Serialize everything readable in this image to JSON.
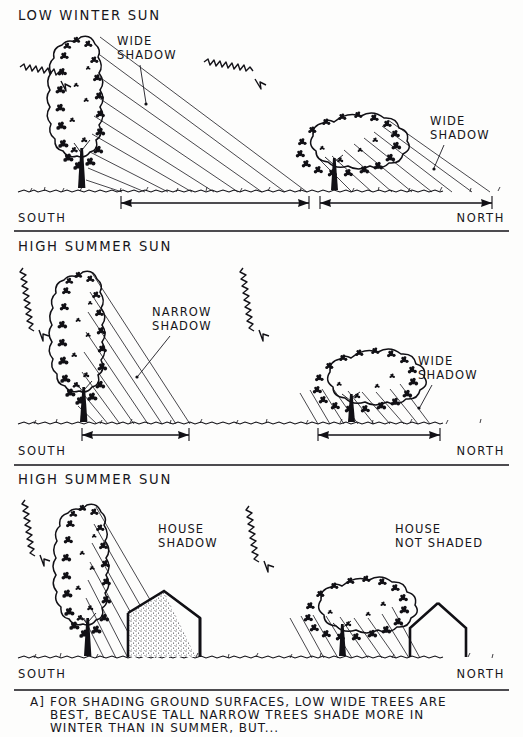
{
  "figure": {
    "ink_color": "#111015",
    "paper_color": "#fdfdfc"
  },
  "panels": [
    {
      "id": "panel-winter",
      "heading": "LOW WINTER SUN",
      "compass_left": "SOUTH",
      "compass_right": "NORTH",
      "sun_rays": [
        "squiggly-arrow-left",
        "squiggly-arrow-right"
      ],
      "trees": [
        {
          "name": "tall-narrow-tree",
          "shape": "tall-columnar",
          "shadow_label": "WIDE\nSHADOW",
          "shadow_label_line1": "WIDE",
          "shadow_label_line2": "SHADOW",
          "shadow_width_measured": true
        },
        {
          "name": "low-wide-tree",
          "shape": "low-spreading",
          "shadow_label_line1": "WIDE",
          "shadow_label_line2": "SHADOW",
          "shadow_width_measured": true
        }
      ]
    },
    {
      "id": "panel-summer-trees",
      "heading": "HIGH SUMMER SUN",
      "compass_left": "SOUTH",
      "compass_right": "NORTH",
      "sun_rays": [
        "squiggly-arrow-left",
        "squiggly-arrow-right"
      ],
      "trees": [
        {
          "name": "tall-narrow-tree",
          "shape": "tall-columnar",
          "shadow_label_line1": "NARROW",
          "shadow_label_line2": "SHADOW",
          "shadow_width_measured": true
        },
        {
          "name": "low-wide-tree",
          "shape": "low-spreading",
          "shadow_label_line1": "WIDE",
          "shadow_label_line2": "SHADOW",
          "shadow_width_measured": true
        }
      ]
    },
    {
      "id": "panel-summer-houses",
      "heading": "HIGH SUMMER SUN",
      "compass_left": "SOUTH",
      "compass_right": "NORTH",
      "sun_rays": [
        "squiggly-arrow-left",
        "squiggly-arrow-right"
      ],
      "scenes": [
        {
          "name": "house-shaded-by-tall-tree",
          "tree_shape": "tall-columnar",
          "label_line1": "HOUSE",
          "label_line2": "SHADOW",
          "house_shadow_fill": "stipple"
        },
        {
          "name": "house-not-shaded-by-wide-tree",
          "tree_shape": "low-spreading",
          "label_line1": "HOUSE",
          "label_line2": "NOT SHADED",
          "house_shadow_fill": "none"
        }
      ]
    }
  ],
  "caption": {
    "marker": "A]",
    "line1": "FOR SHADING GROUND SURFACES,  LOW  WIDE  TREES  ARE",
    "line2": "BEST,  BECAUSE  TALL  NARROW  TREES  SHADE  MORE  IN",
    "line3": "WINTER  THAN  IN  SUMMER,   BUT...",
    "full_text": "A] FOR SHADING GROUND SURFACES, LOW WIDE TREES ARE BEST, BECAUSE TALL NARROW TREES SHADE MORE IN WINTER THAN IN SUMMER, BUT..."
  }
}
